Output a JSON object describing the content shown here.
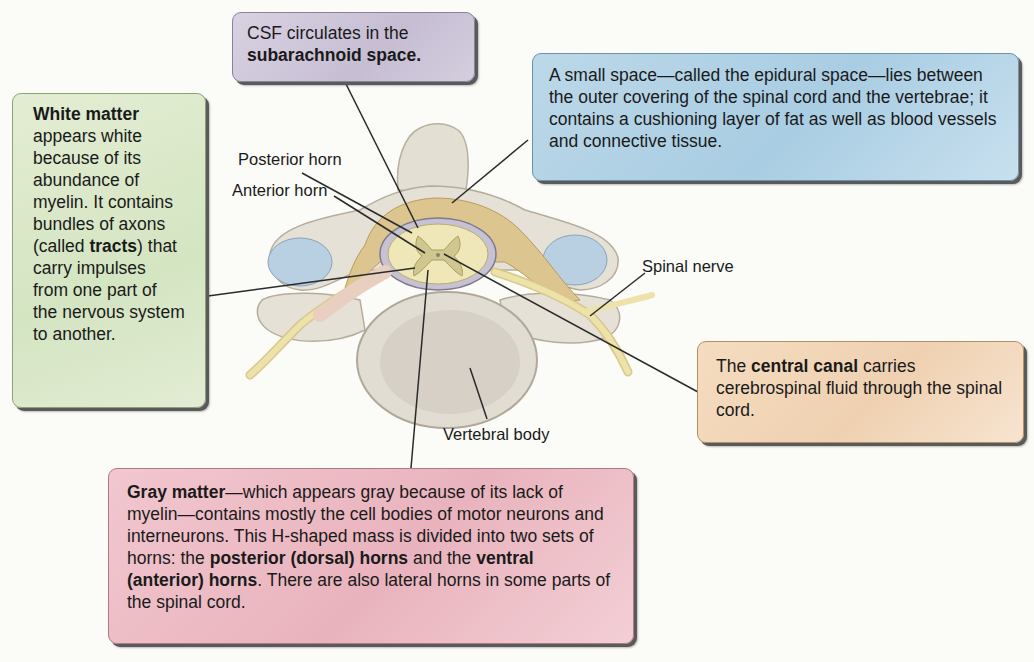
{
  "figure": {
    "labels": {
      "posterior_horn": "Posterior horn",
      "anterior_horn": "Anterior horn",
      "spinal_nerve": "Spinal nerve",
      "vertebral_body": "Vertebral body"
    },
    "callouts": {
      "csf": {
        "line1": "CSF circulates in the",
        "bold": "subarachnoid space."
      },
      "epidural": {
        "text": "A small space—called the epidural space—lies between the outer covering of the spinal cord and the vertebrae; it contains a cushioning layer of fat as well as blood vessels and connective tissue."
      },
      "white_matter": {
        "bold1": "White matter",
        "text1": " appears white because of its abundance of myelin. It contains bundles of axons (called ",
        "bold2": "tracts",
        "text2": ") that carry impulses from one part of the nervous system to another."
      },
      "gray_matter": {
        "bold1": "Gray matter",
        "text1": "—which appears gray because of its lack of myelin—contains mostly the cell bodies of motor neurons and interneurons. This H-shaped mass is divided into two sets of horns: the ",
        "bold2": "posterior (dorsal) horns",
        "text2": " and the ",
        "bold3": "ventral (anterior) horns",
        "text3": ". There are also lateral horns in some parts of the spinal cord."
      },
      "central_canal": {
        "text1": "The ",
        "bold": "central canal",
        "text2": " carries cerebrospinal fluid through the spinal cord."
      }
    },
    "colors": {
      "csf_box": "#c6bdd3",
      "epidural_box": "#a9cde3",
      "white_matter_box": "#d4e5c2",
      "gray_matter_box": "#e9b3bd",
      "central_canal_box": "#efd1b1",
      "bone": "#e6e1d6",
      "cord": "#efe7b8",
      "fat": "#dcc58e",
      "disc_blue": "#b9cfe2",
      "nerve": "#e9dc9c"
    }
  }
}
